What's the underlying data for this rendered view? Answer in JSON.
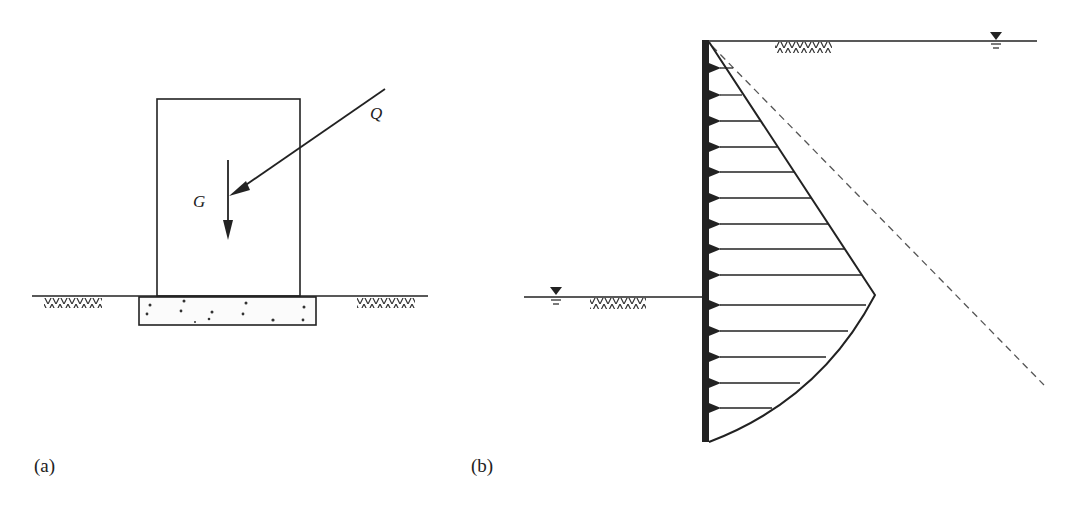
{
  "figure": {
    "panels": [
      {
        "id": "a",
        "label": "(a)",
        "description": "Block on footing subjected to self-weight G and inclined load Q",
        "forces": [
          {
            "symbol": "G",
            "direction": "vertical-down"
          },
          {
            "symbol": "Q",
            "direction": "inclined-down-left"
          }
        ]
      },
      {
        "id": "b",
        "label": "(b)",
        "description": "Retaining wall with lateral earth pressure distribution, water table symbols and dashed hydrostatic line"
      }
    ],
    "colors": {
      "line": "#222222",
      "dashed": "#555555",
      "background": "#ffffff"
    }
  }
}
